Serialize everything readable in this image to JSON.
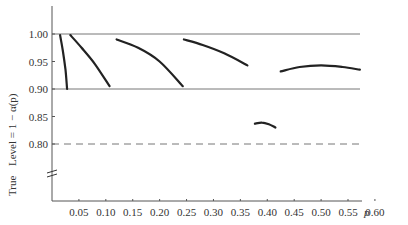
{
  "chart_data": {
    "type": "line",
    "title": "",
    "xlabel": "p",
    "ylabel": "True  Level = 1 − α(p)",
    "xlim": [
      0,
      0.62
    ],
    "ylim": [
      0.75,
      1.05
    ],
    "y_axis_break": true,
    "x_ticks": [
      "0.05",
      "0.10",
      "0.15",
      "0.20",
      "0.25",
      "0.30",
      "0.35",
      "0.40",
      "0.45",
      "0.50",
      "0.55",
      "0.60"
    ],
    "y_ticks": [
      "0.80",
      "0.85",
      "0.90",
      "0.95",
      "1.00"
    ],
    "reference_lines": [
      {
        "y": 1.0,
        "style": "solid"
      },
      {
        "y": 0.9,
        "style": "solid"
      },
      {
        "y": 0.8,
        "style": "dashed"
      }
    ],
    "series": [
      {
        "name": "segment 1",
        "x": [
          0.015,
          0.02,
          0.025,
          0.028
        ],
        "y": [
          0.998,
          0.97,
          0.935,
          0.9
        ]
      },
      {
        "name": "segment 2",
        "x": [
          0.034,
          0.055,
          0.08,
          0.107
        ],
        "y": [
          0.998,
          0.975,
          0.945,
          0.905
        ]
      },
      {
        "name": "segment 3",
        "x": [
          0.12,
          0.16,
          0.2,
          0.243
        ],
        "y": [
          0.99,
          0.975,
          0.95,
          0.905
        ]
      },
      {
        "name": "segment 4",
        "x": [
          0.245,
          0.28,
          0.32,
          0.363
        ],
        "y": [
          0.99,
          0.98,
          0.965,
          0.943
        ]
      },
      {
        "name": "segment 5",
        "x": [
          0.425,
          0.46,
          0.5,
          0.54,
          0.572
        ],
        "y": [
          0.932,
          0.94,
          0.943,
          0.94,
          0.935
        ]
      },
      {
        "name": "segment 6",
        "x": [
          0.377,
          0.39,
          0.403,
          0.415
        ],
        "y": [
          0.837,
          0.839,
          0.836,
          0.83
        ]
      }
    ]
  },
  "labels": {
    "y_title_true": "True",
    "y_title_level": "Level = 1 − α(p)",
    "x_title": "p"
  }
}
